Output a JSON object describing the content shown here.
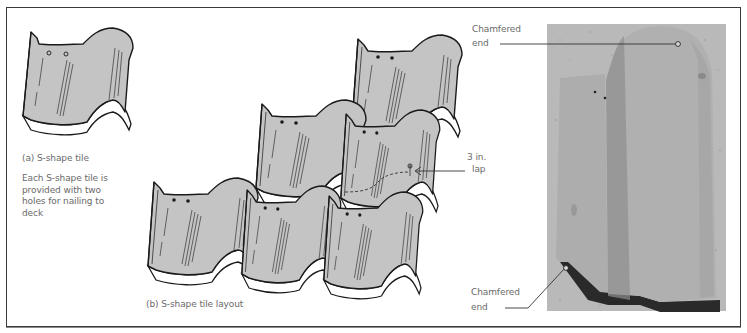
{
  "figure": {
    "panel_a": {
      "caption": "(a) S-shape tile",
      "note": "Each S-shape tile is provided with two holes for nailing to deck"
    },
    "panel_b": {
      "caption": "(b) S-shape tile layout",
      "lap_label_line1": "3 in.",
      "lap_label_line2": "lap"
    },
    "photo": {
      "top_label_line1": "Chamfered",
      "top_label_line2": "end",
      "bottom_label_line1": "Chamfered",
      "bottom_label_line2": "end"
    },
    "colors": {
      "tile_fill": "#c4c4c4",
      "tile_outline": "#1a1a1a",
      "label_text": "#6a6a6a",
      "photo_bg": "#b9b9b9",
      "photo_tile": "#a9a9a9"
    }
  }
}
